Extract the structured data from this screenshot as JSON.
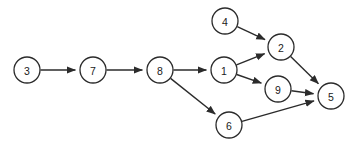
{
  "diagram": {
    "type": "directed-graph",
    "width": 358,
    "height": 147,
    "background_color": "#ffffff",
    "node_stroke_color": "#2b2b2b",
    "node_fill_color": "#ffffff",
    "edge_color": "#2b2b2b",
    "label_color": "#1a1a1a",
    "node_radius": 13,
    "nodes": [
      {
        "id": "3",
        "label": "3",
        "x": 27,
        "y": 70
      },
      {
        "id": "7",
        "label": "7",
        "x": 93,
        "y": 70
      },
      {
        "id": "8",
        "label": "8",
        "x": 160,
        "y": 70
      },
      {
        "id": "1",
        "label": "1",
        "x": 224,
        "y": 70
      },
      {
        "id": "4",
        "label": "4",
        "x": 225,
        "y": 21
      },
      {
        "id": "2",
        "label": "2",
        "x": 281,
        "y": 47
      },
      {
        "id": "9",
        "label": "9",
        "x": 278,
        "y": 89
      },
      {
        "id": "6",
        "label": "6",
        "x": 229,
        "y": 125
      },
      {
        "id": "5",
        "label": "5",
        "x": 331,
        "y": 96
      }
    ],
    "edges": [
      {
        "from": "3",
        "to": "7"
      },
      {
        "from": "7",
        "to": "8"
      },
      {
        "from": "8",
        "to": "1"
      },
      {
        "from": "8",
        "to": "6"
      },
      {
        "from": "4",
        "to": "2"
      },
      {
        "from": "1",
        "to": "2"
      },
      {
        "from": "1",
        "to": "9"
      },
      {
        "from": "2",
        "to": "5"
      },
      {
        "from": "9",
        "to": "5"
      },
      {
        "from": "6",
        "to": "5"
      }
    ]
  }
}
